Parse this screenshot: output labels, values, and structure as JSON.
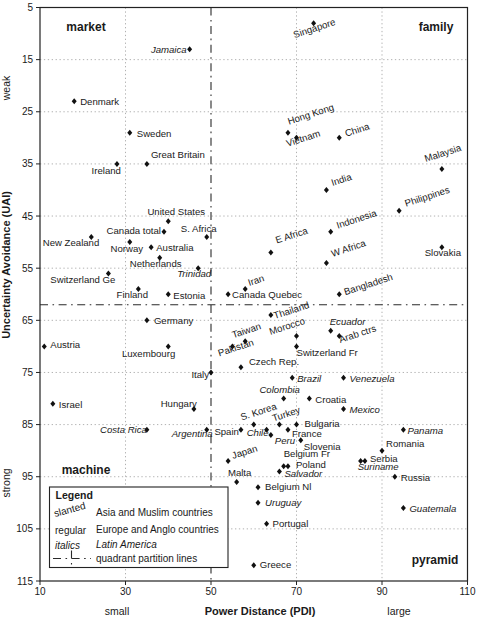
{
  "chart_data": {
    "type": "scatter",
    "title": "",
    "xlabel": "Power Distance (PDI)",
    "ylabel": "Uncertainty Avoidance (UAI)",
    "x_side_labels": {
      "left": "small",
      "right": "large"
    },
    "y_side_labels": {
      "top": "weak",
      "bottom": "strong"
    },
    "xlim": [
      10,
      110
    ],
    "ylim": [
      5,
      115
    ],
    "y_inverted": true,
    "x_ticks": [
      10,
      30,
      50,
      70,
      90,
      110
    ],
    "y_ticks": [
      5,
      15,
      25,
      35,
      45,
      55,
      65,
      75,
      85,
      95,
      105,
      115
    ],
    "x_gridlines": [
      30,
      70,
      90
    ],
    "y_gridlines": [
      15,
      25,
      35,
      45,
      55,
      65,
      75,
      85,
      95,
      105
    ],
    "grid": true,
    "partition": {
      "x": 50,
      "y": 62
    },
    "quadrant_labels": [
      {
        "text": "market",
        "x": 86,
        "y": 31
      },
      {
        "text": "family",
        "x": 436,
        "y": 31
      },
      {
        "text": "machine",
        "x": 86,
        "y": 474
      },
      {
        "text": "pyramid",
        "x": 435,
        "y": 564
      }
    ],
    "groups": {
      "a": {
        "name": "Asia and Muslim countries",
        "style": "slanted"
      },
      "e": {
        "name": "Europe and Anglo countries",
        "style": "regular"
      },
      "l": {
        "name": "Latin America",
        "style": "italics"
      }
    },
    "points": [
      {
        "n": "Singapore",
        "pdi": 74,
        "uai": 8,
        "g": "a",
        "lp": [
          -19,
          15,
          "s"
        ]
      },
      {
        "n": "Jamaica",
        "pdi": 45,
        "uai": 13,
        "g": "l",
        "lp": [
          -3,
          4,
          "e"
        ]
      },
      {
        "n": "Denmark",
        "pdi": 18,
        "uai": 23,
        "g": "e",
        "lp": [
          6,
          4,
          "s"
        ]
      },
      {
        "n": "Sweden",
        "pdi": 31,
        "uai": 29,
        "g": "e",
        "lp": [
          7,
          4,
          "s"
        ]
      },
      {
        "n": "Great Britain",
        "pdi": 35,
        "uai": 35,
        "g": "e",
        "lp": [
          4,
          -6,
          "s"
        ]
      },
      {
        "n": "Ireland",
        "pdi": 28,
        "uai": 35,
        "g": "e",
        "lp": [
          4,
          10,
          "e"
        ]
      },
      {
        "n": "Hong Kong",
        "pdi": 68,
        "uai": 29,
        "g": "a",
        "lp": [
          1,
          -8,
          "s"
        ]
      },
      {
        "n": "Vietnam",
        "pdi": 70,
        "uai": 30,
        "g": "a",
        "lp": [
          -9,
          9,
          "s"
        ]
      },
      {
        "n": "China",
        "pdi": 80,
        "uai": 30,
        "g": "a",
        "lp": [
          7,
          -1,
          "s"
        ]
      },
      {
        "n": "Malaysia",
        "pdi": 104,
        "uai": 36,
        "g": "a",
        "lp": [
          -16,
          -7,
          "s"
        ]
      },
      {
        "n": "India",
        "pdi": 77,
        "uai": 40,
        "g": "a",
        "lp": [
          6,
          -4,
          "s"
        ]
      },
      {
        "n": "Philippines",
        "pdi": 94,
        "uai": 44,
        "g": "a",
        "lp": [
          7,
          -4,
          "s"
        ]
      },
      {
        "n": "Indonesia",
        "pdi": 78,
        "uai": 48,
        "g": "a",
        "lp": [
          7,
          -3,
          "s"
        ]
      },
      {
        "n": "E Africa",
        "pdi": 64,
        "uai": 52,
        "g": "a",
        "lp": [
          6,
          -9,
          "s"
        ]
      },
      {
        "n": "W Africa",
        "pdi": 77,
        "uai": 54,
        "g": "a",
        "lp": [
          6,
          -6,
          "s"
        ]
      },
      {
        "n": "Slovakia",
        "pdi": 104,
        "uai": 51,
        "g": "e",
        "lp": [
          1,
          9,
          "m"
        ]
      },
      {
        "n": "United States",
        "pdi": 40,
        "uai": 46,
        "g": "e",
        "lp": [
          8,
          -6,
          "m"
        ]
      },
      {
        "n": "Canada total",
        "pdi": 39,
        "uai": 48,
        "g": "e",
        "lp": [
          -3,
          2,
          "e"
        ]
      },
      {
        "n": "S. Africa",
        "pdi": 49,
        "uai": 49,
        "g": "e",
        "lp": [
          -8,
          -5,
          "m"
        ]
      },
      {
        "n": "New Zealand",
        "pdi": 22,
        "uai": 49,
        "g": "e",
        "lp": [
          8,
          9,
          "e"
        ]
      },
      {
        "n": "Norway",
        "pdi": 31,
        "uai": 50,
        "g": "e",
        "lp": [
          -3,
          10,
          "m"
        ]
      },
      {
        "n": "Australia",
        "pdi": 36,
        "uai": 51,
        "g": "e",
        "lp": [
          5,
          4,
          "s"
        ]
      },
      {
        "n": "Netherlands",
        "pdi": 38,
        "uai": 53,
        "g": "e",
        "lp": [
          -4,
          9,
          "m"
        ]
      },
      {
        "n": "Switzerland Ge",
        "pdi": 26,
        "uai": 56,
        "g": "e",
        "lp": [
          7,
          10,
          "e"
        ]
      },
      {
        "n": "Trinidad",
        "pdi": 47,
        "uai": 55,
        "g": "l",
        "lp": [
          -4,
          9,
          "m"
        ]
      },
      {
        "n": "Finland",
        "pdi": 33,
        "uai": 59,
        "g": "e",
        "lp": [
          -6,
          9,
          "m"
        ]
      },
      {
        "n": "Estonia",
        "pdi": 40,
        "uai": 60,
        "g": "e",
        "lp": [
          5,
          5,
          "s"
        ]
      },
      {
        "n": "Canada Quebec",
        "pdi": 54,
        "uai": 60,
        "g": "e",
        "lp": [
          4,
          4,
          "s"
        ]
      },
      {
        "n": "Iran",
        "pdi": 58,
        "uai": 59,
        "g": "a",
        "lp": [
          4,
          -3,
          "s"
        ]
      },
      {
        "n": "Bangladesh",
        "pdi": 80,
        "uai": 60,
        "g": "a",
        "lp": [
          6,
          1,
          "s"
        ]
      },
      {
        "n": "Germany",
        "pdi": 35,
        "uai": 65,
        "g": "e",
        "lp": [
          7,
          4,
          "s"
        ]
      },
      {
        "n": "Austria",
        "pdi": 11,
        "uai": 70,
        "g": "e",
        "lp": [
          6,
          2,
          "s"
        ]
      },
      {
        "n": "Luxembourg",
        "pdi": 40,
        "uai": 70,
        "g": "e",
        "lp": [
          7,
          11,
          "e"
        ]
      },
      {
        "n": "Italy",
        "pdi": 50,
        "uai": 75,
        "g": "e",
        "lp": [
          -2,
          6,
          "e"
        ]
      },
      {
        "n": "Israel",
        "pdi": 13,
        "uai": 81,
        "g": "e",
        "lp": [
          6,
          4,
          "s"
        ]
      },
      {
        "n": "Hungary",
        "pdi": 46,
        "uai": 82,
        "g": "e",
        "lp": [
          3,
          -2,
          "e"
        ]
      },
      {
        "n": "Costa Rica",
        "pdi": 35,
        "uai": 86,
        "g": "l",
        "lp": [
          0,
          3,
          "e"
        ]
      },
      {
        "n": "Argentina",
        "pdi": 49,
        "uai": 86,
        "g": "l",
        "lp": [
          6,
          7,
          "e"
        ]
      },
      {
        "n": "Spain",
        "pdi": 57,
        "uai": 86,
        "g": "e",
        "lp": [
          -2,
          5,
          "e"
        ]
      },
      {
        "n": "S. Korea",
        "pdi": 60,
        "uai": 85,
        "g": "a",
        "lp": [
          -12,
          -4,
          "s"
        ]
      },
      {
        "n": "Turkey",
        "pdi": 66,
        "uai": 85,
        "g": "a",
        "lp": [
          -6,
          -3,
          "s"
        ]
      },
      {
        "n": "Chile",
        "pdi": 63,
        "uai": 86,
        "g": "l",
        "lp": [
          2,
          6,
          "e"
        ]
      },
      {
        "n": "France",
        "pdi": 68,
        "uai": 86,
        "g": "e",
        "lp": [
          4,
          7,
          "s"
        ]
      },
      {
        "n": "Peru",
        "pdi": 64,
        "uai": 87,
        "g": "l",
        "lp": [
          4,
          9,
          "s"
        ]
      },
      {
        "n": "Bulgaria",
        "pdi": 70,
        "uai": 85,
        "g": "e",
        "lp": [
          8,
          2,
          "s"
        ]
      },
      {
        "n": "Slovenia",
        "pdi": 71,
        "uai": 88,
        "g": "e",
        "lp": [
          3,
          10,
          "s"
        ]
      },
      {
        "n": "Belgium Fr",
        "pdi": 67,
        "uai": 93,
        "g": "e",
        "lp": [
          0,
          -9,
          "s"
        ]
      },
      {
        "n": "Poland",
        "pdi": 68,
        "uai": 93,
        "g": "e",
        "lp": [
          8,
          2,
          "s"
        ]
      },
      {
        "n": "Salvador",
        "pdi": 66,
        "uai": 94,
        "g": "l",
        "lp": [
          5,
          5,
          "s"
        ]
      },
      {
        "n": "Japan",
        "pdi": 54,
        "uai": 92,
        "g": "a",
        "lp": [
          5,
          -2,
          "s"
        ]
      },
      {
        "n": "Malta",
        "pdi": 56,
        "uai": 96,
        "g": "e",
        "lp": [
          3,
          -6,
          "m"
        ]
      },
      {
        "n": "Belgium Nl",
        "pdi": 61,
        "uai": 97,
        "g": "e",
        "lp": [
          7,
          3,
          "s"
        ]
      },
      {
        "n": "Uruguay",
        "pdi": 61,
        "uai": 100,
        "g": "l",
        "lp": [
          7,
          3,
          "s"
        ]
      },
      {
        "n": "Portugal",
        "pdi": 63,
        "uai": 104,
        "g": "e",
        "lp": [
          6,
          3,
          "s"
        ]
      },
      {
        "n": "Greece",
        "pdi": 60,
        "uai": 112,
        "g": "e",
        "lp": [
          6,
          3,
          "s"
        ]
      },
      {
        "n": "Romania",
        "pdi": 90,
        "uai": 90,
        "g": "e",
        "lp": [
          4,
          -4,
          "s"
        ]
      },
      {
        "n": "Serbia",
        "pdi": 86,
        "uai": 92,
        "g": "e",
        "lp": [
          5,
          1,
          "s"
        ]
      },
      {
        "n": "Suriname",
        "pdi": 85,
        "uai": 92,
        "g": "l",
        "lp": [
          -3,
          9,
          "s"
        ]
      },
      {
        "n": "Russia",
        "pdi": 93,
        "uai": 95,
        "g": "e",
        "lp": [
          6,
          4,
          "s"
        ]
      },
      {
        "n": "Guatemala",
        "pdi": 95,
        "uai": 101,
        "g": "l",
        "lp": [
          6,
          4,
          "s"
        ]
      },
      {
        "n": "Panama",
        "pdi": 95,
        "uai": 86,
        "g": "l",
        "lp": [
          4,
          4,
          "s"
        ]
      },
      {
        "n": "Mexico",
        "pdi": 81,
        "uai": 82,
        "g": "l",
        "lp": [
          6,
          4,
          "s"
        ]
      },
      {
        "n": "Croatia",
        "pdi": 73,
        "uai": 80,
        "g": "e",
        "lp": [
          6,
          4,
          "s"
        ]
      },
      {
        "n": "Colombia",
        "pdi": 67,
        "uai": 80,
        "g": "l",
        "lp": [
          -4,
          -6,
          "m"
        ]
      },
      {
        "n": "Brazil",
        "pdi": 69,
        "uai": 76,
        "g": "l",
        "lp": [
          5,
          4,
          "s"
        ]
      },
      {
        "n": "Venezuela",
        "pdi": 81,
        "uai": 76,
        "g": "l",
        "lp": [
          6,
          4,
          "s"
        ]
      },
      {
        "n": "Czech Rep.",
        "pdi": 57,
        "uai": 74,
        "g": "e",
        "lp": [
          8,
          -2,
          "s"
        ]
      },
      {
        "n": "Pakistan",
        "pdi": 55,
        "uai": 70,
        "g": "a",
        "lp": [
          -13,
          10,
          "s"
        ]
      },
      {
        "n": "Taiwan",
        "pdi": 58,
        "uai": 69,
        "g": "a",
        "lp": [
          -12,
          -3,
          "s"
        ]
      },
      {
        "n": "Thailand",
        "pdi": 64,
        "uai": 64,
        "g": "a",
        "lp": [
          4,
          4,
          "s"
        ]
      },
      {
        "n": "Morocco",
        "pdi": 70,
        "uai": 68,
        "g": "a",
        "lp": [
          -26,
          -1,
          "s"
        ]
      },
      {
        "n": "Ecuador",
        "pdi": 78,
        "uai": 67,
        "g": "l",
        "lp": [
          -1,
          -6,
          "s"
        ]
      },
      {
        "n": "Arab ctrs",
        "pdi": 80,
        "uai": 68,
        "g": "a",
        "lp": [
          1,
          7,
          "s"
        ]
      },
      {
        "n": "Switzerland Fr",
        "pdi": 70,
        "uai": 70,
        "g": "e",
        "lp": [
          0,
          10,
          "s"
        ]
      }
    ]
  },
  "legend": {
    "title": "Legend",
    "rows": [
      {
        "key": "slanted",
        "style": "slanted",
        "text": "Asia and Muslim countries"
      },
      {
        "key": "regular",
        "style": "regular",
        "text": "Europe and Anglo countries"
      },
      {
        "key": "italics",
        "style": "italics",
        "text": "Latin America"
      },
      {
        "key": "line",
        "style": "line",
        "text": "quadrant partition lines"
      }
    ]
  },
  "colors": {
    "text": "#1a1a1a",
    "point": "#111111",
    "gridline": "#a8a8a8",
    "partition": "#2a2a2a",
    "border": "#222222",
    "background": "#ffffff"
  }
}
